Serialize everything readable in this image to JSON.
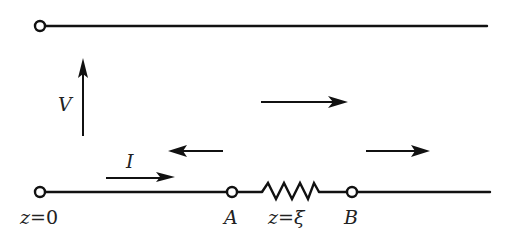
{
  "diagram": {
    "type": "transmission-line",
    "colors": {
      "line": "#111111",
      "background": "#ffffff",
      "text": "#222222"
    },
    "labels": {
      "voltage": "V",
      "current": "I",
      "origin_var": "z",
      "origin_eq": "=",
      "origin_val": "0",
      "node_a": "A",
      "resistor_var": "z",
      "resistor_eq": "=",
      "resistor_val": "ξ",
      "node_b": "B"
    },
    "waves": [
      {
        "name": "incident-wave",
        "direction": "right"
      },
      {
        "name": "reflected-wave",
        "direction": "left"
      },
      {
        "name": "transmitted-wave",
        "direction": "right"
      }
    ]
  }
}
